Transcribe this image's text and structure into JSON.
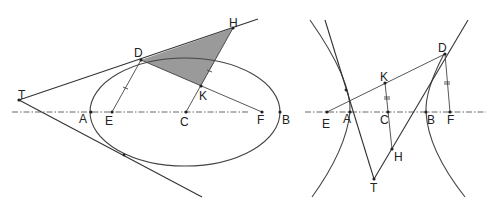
{
  "left_figure": {
    "type": "ellipse",
    "labels": {
      "T": "T",
      "D": "D",
      "H": "H",
      "K": "K",
      "A": "A",
      "E": "E",
      "C": "C",
      "F": "F",
      "B": "B"
    },
    "shaded_region": "triangle DHK",
    "equal_marks": [
      "DE",
      "KH"
    ]
  },
  "right_figure": {
    "type": "hyperbola",
    "labels": {
      "D": "D",
      "K": "K",
      "E": "E",
      "A": "A",
      "C": "C",
      "B": "B",
      "F": "F",
      "H": "H",
      "T": "T"
    },
    "equal_marks": [
      "KC",
      "DF"
    ]
  },
  "colors": {
    "line": "#333333",
    "shade": "#9a9a9a",
    "background": "#ffffff"
  }
}
